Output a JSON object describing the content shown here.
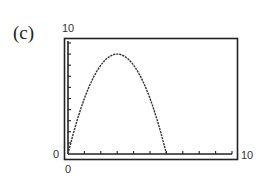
{
  "panel_label": "(c)",
  "window": {
    "xmin_label": "0",
    "xmax_label": "10",
    "ymin_label": "0",
    "ymax_label": "10"
  },
  "chart_data": {
    "type": "line",
    "title": "(c)",
    "xlabel": "",
    "ylabel": "",
    "xlim": [
      0,
      10
    ],
    "ylim": [
      0,
      10
    ],
    "x_ticks": [
      0,
      1,
      2,
      3,
      4,
      5,
      6,
      7,
      8,
      9,
      10
    ],
    "y_ticks": [
      0,
      1,
      2,
      3,
      4,
      5,
      6,
      7,
      8,
      9,
      10
    ],
    "grid": false,
    "series": [
      {
        "name": "y = x(6 - x)",
        "x": [
          0,
          0.5,
          1,
          1.5,
          2,
          2.5,
          3,
          3.5,
          4,
          4.5,
          5,
          5.5,
          6
        ],
        "y": [
          0,
          2.75,
          5,
          6.75,
          8,
          8.75,
          9,
          8.75,
          8,
          6.75,
          5,
          2.75,
          0
        ]
      }
    ],
    "annotations": [
      "Graphing-calculator viewing window [0,10] x [0,10]"
    ]
  },
  "colors": {
    "frame": "#222222",
    "curve": "#333333",
    "axis": "#222222"
  }
}
